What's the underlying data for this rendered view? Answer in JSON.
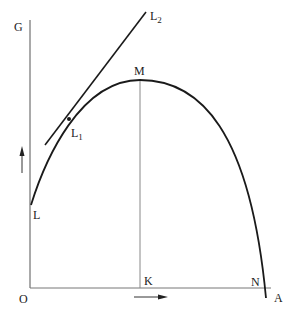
{
  "diagram": {
    "type": "curve-with-tangent",
    "labels": {
      "G": "G",
      "O": "O",
      "K": "K",
      "N": "N",
      "A": "A",
      "M": "M",
      "L": "L",
      "L1_main": "L",
      "L1_sub": "1",
      "L2_main": "L",
      "L2_sub": "2"
    },
    "colors": {
      "curve": "#1a1a1a",
      "axis": "#555555",
      "guide": "#888888",
      "background": "#ffffff"
    }
  }
}
